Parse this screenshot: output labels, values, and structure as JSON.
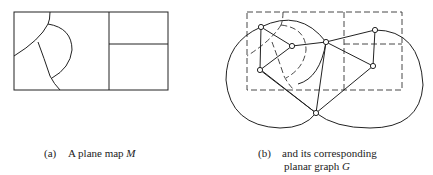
{
  "figure": {
    "panel_a": {
      "label": "(a)",
      "caption_text": "A plane map ",
      "caption_symbol": "M"
    },
    "panel_b": {
      "label": "(b)",
      "caption_line1": "and its corresponding",
      "caption_line2_text": "planar graph ",
      "caption_symbol": "G",
      "vertices": [
        {
          "id": "v1",
          "x": 261,
          "y": 27
        },
        {
          "id": "v2",
          "x": 292,
          "y": 46
        },
        {
          "id": "v3",
          "x": 260,
          "y": 70
        },
        {
          "id": "v4",
          "x": 326,
          "y": 42
        },
        {
          "id": "v5",
          "x": 375,
          "y": 30
        },
        {
          "id": "v6",
          "x": 373,
          "y": 66
        },
        {
          "id": "v7",
          "x": 316,
          "y": 113
        }
      ]
    },
    "colors": {
      "ink": "#222222",
      "background": "#ffffff"
    }
  }
}
